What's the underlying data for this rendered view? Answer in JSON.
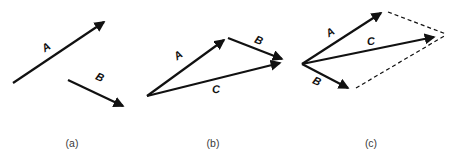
{
  "colors": {
    "arrow-color": "#111111",
    "caption-color": "#3a3a3a"
  },
  "figure": {
    "panels": [
      {
        "caption": "(a)",
        "vector_a_label": "A",
        "vector_b_label": "B"
      },
      {
        "caption": "(b)",
        "vector_a_label": "A",
        "vector_b_label": "B",
        "vector_c_label": "C"
      },
      {
        "caption": "(c)",
        "vector_a_label": "A",
        "vector_b_label": "B",
        "vector_c_label": "C"
      }
    ]
  }
}
